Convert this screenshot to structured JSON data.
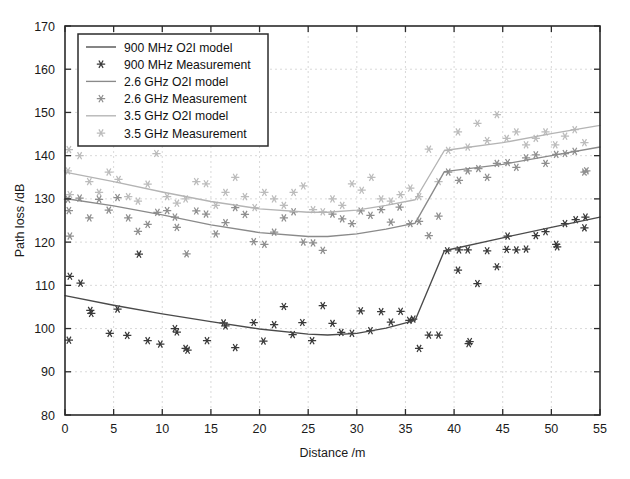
{
  "chart_data": {
    "type": "scatter",
    "title": "",
    "xlabel": "Distance /m",
    "ylabel": "Path loss /dB",
    "xlim": [
      0,
      55
    ],
    "ylim": [
      80,
      170
    ],
    "xticks": [
      0,
      5,
      10,
      15,
      20,
      25,
      30,
      35,
      40,
      45,
      50,
      55
    ],
    "yticks": [
      80,
      90,
      100,
      110,
      120,
      130,
      140,
      150,
      160,
      170
    ],
    "grid": true,
    "legend_position": "upper-left",
    "legend_entries": [
      {
        "label": "900 MHz O2I model",
        "marker": "line",
        "color": "#4a4a4a"
      },
      {
        "label": "900 MHz Measurement",
        "marker": "asterisk",
        "color": "#3a3a3a"
      },
      {
        "label": "2.6 GHz O2I model",
        "marker": "line",
        "color": "#8a8a8a"
      },
      {
        "label": "2.6 GHz Measurement",
        "marker": "asterisk",
        "color": "#8f8f8f"
      },
      {
        "label": "3.5 GHz O2I model",
        "marker": "line",
        "color": "#b4b4b4"
      },
      {
        "label": "3.5 GHz Measurement",
        "marker": "asterisk",
        "color": "#bcbcbc"
      }
    ],
    "series": [
      {
        "name": "900 MHz O2I model",
        "type": "line",
        "color": "#4a4a4a",
        "x": [
          0,
          5,
          10,
          15,
          20,
          25,
          27,
          30,
          33,
          36,
          39,
          45,
          50,
          55
        ],
        "y": [
          107.6,
          105.4,
          103.4,
          101.6,
          99.9,
          98.7,
          98.5,
          98.9,
          100.1,
          101.9,
          118.0,
          121.0,
          123.4,
          125.8
        ]
      },
      {
        "name": "2.6 GHz O2I model",
        "type": "line",
        "color": "#8a8a8a",
        "x": [
          0,
          5,
          10,
          15,
          20,
          25,
          27,
          30,
          33,
          36,
          39,
          45,
          50,
          55
        ],
        "y": [
          130.1,
          128.4,
          126.3,
          124.0,
          122.2,
          121.3,
          121.3,
          121.9,
          123.0,
          124.4,
          136.3,
          138.0,
          140.0,
          142.0
        ]
      },
      {
        "name": "3.5 GHz O2I model",
        "type": "line",
        "color": "#b4b4b4",
        "x": [
          0,
          5,
          10,
          15,
          20,
          25,
          27,
          30,
          33,
          36,
          39,
          45,
          50,
          55
        ],
        "y": [
          136.2,
          134.0,
          131.6,
          129.4,
          127.7,
          126.9,
          126.9,
          127.4,
          128.5,
          129.8,
          141.2,
          143.0,
          145.1,
          147.0
        ]
      },
      {
        "name": "900 MHz Measurement",
        "type": "scatter",
        "color": "#3a3a3a",
        "points": [
          [
            0.4,
            97.3
          ],
          [
            0.5,
            112.1
          ],
          [
            1.6,
            110.5
          ],
          [
            2.6,
            104.2
          ],
          [
            2.7,
            103.5
          ],
          [
            4.6,
            98.9
          ],
          [
            5.4,
            104.5
          ],
          [
            6.4,
            98.4
          ],
          [
            7.6,
            117.2
          ],
          [
            8.5,
            97.2
          ],
          [
            9.8,
            96.4
          ],
          [
            11.3,
            100.0
          ],
          [
            11.5,
            99.2
          ],
          [
            12.4,
            95.4
          ],
          [
            12.6,
            95.0
          ],
          [
            14.6,
            97.2
          ],
          [
            16.3,
            101.3
          ],
          [
            16.5,
            100.6
          ],
          [
            17.5,
            95.6
          ],
          [
            19.4,
            101.4
          ],
          [
            20.4,
            97.1
          ],
          [
            21.5,
            100.9
          ],
          [
            22.5,
            105.1
          ],
          [
            23.4,
            98.6
          ],
          [
            24.4,
            101.4
          ],
          [
            25.4,
            97.2
          ],
          [
            26.5,
            105.3
          ],
          [
            27.5,
            101.2
          ],
          [
            28.4,
            99.1
          ],
          [
            29.5,
            98.9
          ],
          [
            30.4,
            104.1
          ],
          [
            31.4,
            99.5
          ],
          [
            32.5,
            103.9
          ],
          [
            33.5,
            101.5
          ],
          [
            34.5,
            104.0
          ],
          [
            35.4,
            101.9
          ],
          [
            35.8,
            102.2
          ],
          [
            36.4,
            95.4
          ],
          [
            37.4,
            98.5
          ],
          [
            38.4,
            98.5
          ],
          [
            39.3,
            118.0
          ],
          [
            40.4,
            113.5
          ],
          [
            40.5,
            118.2
          ],
          [
            41.4,
            118.2
          ],
          [
            41.5,
            96.5
          ],
          [
            41.6,
            97.0
          ],
          [
            42.4,
            110.4
          ],
          [
            43.4,
            118.0
          ],
          [
            44.4,
            114.3
          ],
          [
            45.4,
            118.3
          ],
          [
            45.5,
            121.4
          ],
          [
            46.4,
            118.2
          ],
          [
            47.4,
            118.4
          ],
          [
            48.4,
            121.5
          ],
          [
            49.4,
            122.4
          ],
          [
            50.5,
            119.5
          ],
          [
            50.6,
            118.9
          ],
          [
            51.4,
            124.3
          ],
          [
            52.5,
            125.2
          ],
          [
            53.4,
            123.3
          ],
          [
            53.5,
            125.8
          ]
        ]
      },
      {
        "name": "2.6 GHz Measurement",
        "type": "scatter",
        "color": "#8f8f8f",
        "points": [
          [
            0.3,
            129.9
          ],
          [
            0.4,
            127.3
          ],
          [
            0.5,
            121.4
          ],
          [
            1.5,
            130.2
          ],
          [
            2.5,
            125.6
          ],
          [
            3.5,
            129.9
          ],
          [
            4.5,
            127.4
          ],
          [
            5.4,
            130.3
          ],
          [
            6.5,
            125.6
          ],
          [
            7.5,
            122.5
          ],
          [
            8.5,
            124.1
          ],
          [
            9.5,
            126.9
          ],
          [
            10.5,
            127.3
          ],
          [
            11.3,
            125.8
          ],
          [
            11.5,
            123.4
          ],
          [
            12.5,
            117.3
          ],
          [
            13.5,
            127.2
          ],
          [
            14.5,
            126.5
          ],
          [
            15.5,
            121.9
          ],
          [
            16.5,
            124.5
          ],
          [
            17.5,
            128.0
          ],
          [
            18.5,
            126.4
          ],
          [
            19.4,
            120.1
          ],
          [
            20.5,
            119.5
          ],
          [
            21.5,
            122.3
          ],
          [
            22.5,
            125.6
          ],
          [
            23.5,
            127.0
          ],
          [
            24.5,
            120.0
          ],
          [
            25.5,
            119.8
          ],
          [
            26.5,
            118.1
          ],
          [
            27.5,
            126.5
          ],
          [
            28.5,
            125.4
          ],
          [
            29.5,
            124.3
          ],
          [
            30.4,
            127.2
          ],
          [
            31.4,
            126.2
          ],
          [
            32.5,
            127.5
          ],
          [
            33.5,
            124.6
          ],
          [
            34.4,
            128.1
          ],
          [
            35.5,
            124.3
          ],
          [
            36.4,
            124.8
          ],
          [
            37.4,
            121.5
          ],
          [
            38.4,
            126.0
          ],
          [
            39.4,
            136.2
          ],
          [
            40.5,
            134.3
          ],
          [
            41.4,
            136.5
          ],
          [
            42.5,
            137.0
          ],
          [
            43.4,
            135.0
          ],
          [
            44.4,
            138.2
          ],
          [
            45.5,
            138.4
          ],
          [
            46.4,
            137.3
          ],
          [
            47.4,
            139.5
          ],
          [
            48.4,
            140.2
          ],
          [
            49.4,
            138.2
          ],
          [
            50.5,
            140.3
          ],
          [
            51.4,
            140.5
          ],
          [
            52.4,
            141.0
          ],
          [
            53.4,
            136.2
          ],
          [
            53.6,
            136.5
          ]
        ]
      },
      {
        "name": "3.5 GHz Measurement",
        "type": "scatter",
        "color": "#bcbcbc",
        "points": [
          [
            0.3,
            136.5
          ],
          [
            0.4,
            141.4
          ],
          [
            0.5,
            131.0
          ],
          [
            1.5,
            140.0
          ],
          [
            2.5,
            134.0
          ],
          [
            3.5,
            131.5
          ],
          [
            4.5,
            136.2
          ],
          [
            5.5,
            134.5
          ],
          [
            6.5,
            130.5
          ],
          [
            7.5,
            129.5
          ],
          [
            8.5,
            133.4
          ],
          [
            9.4,
            140.5
          ],
          [
            10.5,
            130.5
          ],
          [
            11.5,
            129.0
          ],
          [
            12.4,
            130.0
          ],
          [
            13.5,
            134.0
          ],
          [
            14.5,
            133.5
          ],
          [
            15.5,
            128.5
          ],
          [
            16.5,
            131.5
          ],
          [
            17.5,
            135.0
          ],
          [
            18.5,
            130.5
          ],
          [
            19.5,
            128.0
          ],
          [
            20.5,
            131.5
          ],
          [
            21.5,
            130.0
          ],
          [
            22.5,
            128.5
          ],
          [
            23.5,
            131.5
          ],
          [
            24.5,
            133.0
          ],
          [
            25.5,
            127.5
          ],
          [
            26.5,
            127.0
          ],
          [
            27.5,
            130.0
          ],
          [
            28.5,
            128.5
          ],
          [
            29.5,
            133.5
          ],
          [
            30.5,
            132.0
          ],
          [
            31.5,
            135.0
          ],
          [
            32.5,
            130.0
          ],
          [
            33.5,
            129.5
          ],
          [
            34.5,
            131.0
          ],
          [
            35.5,
            132.5
          ],
          [
            36.4,
            130.5
          ],
          [
            37.4,
            141.5
          ],
          [
            38.4,
            134.0
          ],
          [
            39.4,
            141.2
          ],
          [
            40.4,
            145.5
          ],
          [
            41.4,
            142.0
          ],
          [
            42.4,
            147.5
          ],
          [
            43.4,
            143.5
          ],
          [
            44.4,
            149.5
          ],
          [
            45.4,
            144.0
          ],
          [
            46.4,
            145.5
          ],
          [
            47.4,
            142.5
          ],
          [
            48.4,
            144.0
          ],
          [
            49.4,
            145.5
          ],
          [
            50.4,
            142.5
          ],
          [
            51.4,
            144.5
          ],
          [
            52.4,
            146.0
          ],
          [
            53.4,
            143.0
          ]
        ]
      }
    ]
  }
}
